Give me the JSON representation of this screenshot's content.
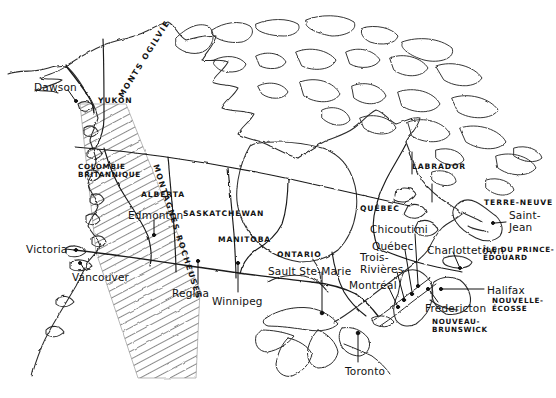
{
  "map": {
    "title": "Carte du Canada",
    "language": "fr",
    "style": "hand-drawn pen sketch, black ink on white",
    "colors": {
      "ink": "#121212",
      "coast": "#2b2b2b",
      "background": "#ffffff",
      "hatch": "#555555"
    },
    "provinces": [
      {
        "id": "yukon",
        "label": "YUKON",
        "x": 98,
        "y": 97,
        "class": "prov"
      },
      {
        "id": "colombie-brit",
        "label": "COLOMBIE\nBRITANNIQUE",
        "x": 78,
        "y": 163,
        "class": "prov2"
      },
      {
        "id": "alberta",
        "label": "ALBERTA",
        "x": 141,
        "y": 191,
        "class": "prov"
      },
      {
        "id": "saskatchewan",
        "label": "SASKATCHEWAN",
        "x": 183,
        "y": 210,
        "class": "prov"
      },
      {
        "id": "manitoba",
        "label": "MANITOBA",
        "x": 218,
        "y": 236,
        "class": "prov"
      },
      {
        "id": "ontario",
        "label": "ONTARIO",
        "x": 277,
        "y": 251,
        "class": "prov"
      },
      {
        "id": "quebec",
        "label": "QUÉBEC",
        "x": 360,
        "y": 205,
        "class": "prov"
      },
      {
        "id": "labrador",
        "label": "LABRADOR",
        "x": 412,
        "y": 163,
        "class": "prov"
      },
      {
        "id": "terre-neuve",
        "label": "TERRE-NEUVE",
        "x": 484,
        "y": 199,
        "class": "prov"
      },
      {
        "id": "ile-prince-edouard",
        "label": "ÎLE DU PRINCE-\nÉDOUARD",
        "x": 483,
        "y": 246,
        "class": "prov2"
      },
      {
        "id": "nouvelle-ecosse",
        "label": "NOUVELLE-\nÉCOSSE",
        "x": 492,
        "y": 297,
        "class": "prov2"
      },
      {
        "id": "nouveau-brunswick",
        "label": "NOUVEAU-\nBRUNSWICK",
        "x": 432,
        "y": 318,
        "class": "prov2"
      }
    ],
    "cities": [
      {
        "id": "dawson",
        "label": "Dawson",
        "x": 34,
        "y": 82,
        "dot": [
          74,
          101
        ],
        "leader": [
          [
            68,
            90
          ],
          [
            74,
            100
          ]
        ]
      },
      {
        "id": "victoria",
        "label": "Victoria",
        "x": 26,
        "y": 244,
        "dot": [
          75,
          250
        ],
        "leader": [
          [
            68,
            249
          ],
          [
            74,
            250
          ]
        ]
      },
      {
        "id": "vancouver",
        "label": "Vancouver",
        "x": 72,
        "y": 272,
        "dot": [
          80,
          263
        ],
        "leader": [
          [
            82,
            269
          ],
          [
            80,
            264
          ]
        ]
      },
      {
        "id": "edmonton",
        "label": "Edmonton",
        "x": 128,
        "y": 210,
        "dot": [
          154,
          235
        ],
        "leader": [
          [
            154,
            220
          ],
          [
            154,
            233
          ]
        ]
      },
      {
        "id": "regina",
        "label": "Regina",
        "x": 172,
        "y": 288,
        "dot": [
          198,
          261
        ],
        "leader": [
          [
            198,
            284
          ],
          [
            198,
            263
          ]
        ]
      },
      {
        "id": "winnipeg",
        "label": "Winnipeg",
        "x": 212,
        "y": 296,
        "dot": [
          238,
          263
        ],
        "leader": [
          [
            238,
            292
          ],
          [
            238,
            265
          ]
        ]
      },
      {
        "id": "sault-ste-marie",
        "label": "Sault Ste-Marie",
        "x": 268,
        "y": 266,
        "dot": [
          322,
          313
        ],
        "leader": [
          [
            322,
            272
          ],
          [
            322,
            311
          ]
        ]
      },
      {
        "id": "toronto",
        "label": "Toronto",
        "x": 345,
        "y": 366,
        "dot": [
          358,
          333
        ],
        "leader": [
          [
            358,
            362
          ],
          [
            358,
            335
          ]
        ]
      },
      {
        "id": "montreal",
        "label": "Montréal",
        "x": 349,
        "y": 280,
        "dot": [
          398,
          307
        ],
        "leader": [
          [
            387,
            286
          ],
          [
            397,
            306
          ]
        ]
      },
      {
        "id": "trois-rivieres",
        "label": "Trois-\nRivières",
        "x": 360,
        "y": 252,
        "dot": [
          404,
          300
        ],
        "leader": [
          [
            396,
            272
          ],
          [
            404,
            299
          ]
        ]
      },
      {
        "id": "quebec-city",
        "label": "Québec",
        "x": 372,
        "y": 241,
        "dot": [
          412,
          294
        ],
        "leader": [
          [
            404,
            250
          ],
          [
            412,
            293
          ]
        ]
      },
      {
        "id": "chicoutimi",
        "label": "Chicoutimi",
        "x": 370,
        "y": 224,
        "dot": [
          418,
          286
        ],
        "leader": [
          [
            414,
            234
          ],
          [
            418,
            285
          ]
        ]
      },
      {
        "id": "saint-jean",
        "label": "Saint-\nJean",
        "x": 509,
        "y": 210,
        "dot": [
          492,
          222
        ],
        "leader": [
          [
            506,
            222
          ],
          [
            495,
            223
          ]
        ]
      },
      {
        "id": "charlottetown",
        "label": "Charlottetown",
        "x": 427,
        "y": 245,
        "dot": [
          460,
          268
        ],
        "leader": [
          [
            452,
            252
          ],
          [
            459,
            267
          ]
        ]
      },
      {
        "id": "halifax",
        "label": "Halifax",
        "x": 487,
        "y": 285,
        "dot": [
          440,
          289
        ],
        "leader": [
          [
            484,
            289
          ],
          [
            443,
            289
          ]
        ]
      },
      {
        "id": "fredericton",
        "label": "Fredericton",
        "x": 425,
        "y": 303,
        "dot": [
          428,
          288
        ],
        "leader": [
          [
            438,
            302
          ],
          [
            430,
            291
          ]
        ]
      }
    ],
    "ranges": [
      {
        "id": "monts-ogilvie",
        "label": "MONTS OGILVIE",
        "x": 100,
        "y": 55,
        "rotate": -58
      },
      {
        "id": "montagnes-rocheuses",
        "label": "MONTAGNES ROCHEUSES",
        "x": 106,
        "y": 228,
        "rotate": 72
      }
    ],
    "features": {
      "hudson_bay": "Hudson Bay (unlabeled)",
      "great_lakes": "Great Lakes (unlabeled)",
      "border_49th": "Canada–USA border (49th parallel)",
      "border_60th": "60th parallel territorial boundary",
      "rockies_hatching": "diagonal hatched band marking the Rocky Mountains"
    }
  }
}
